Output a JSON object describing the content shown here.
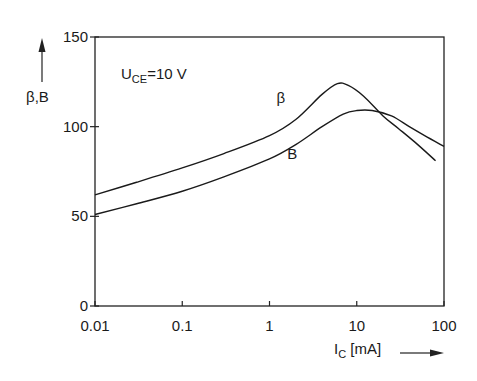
{
  "chart_data": {
    "type": "line",
    "title": "",
    "annotation": {
      "main": "U",
      "sub": "CE",
      "rest": "=10 V"
    },
    "xlabel": {
      "main": "I",
      "sub": "C",
      "rest": " [mA]"
    },
    "ylabel": "β,B",
    "xscale": "log",
    "xlim": [
      0.01,
      100
    ],
    "ylim": [
      0,
      150
    ],
    "xticks": [
      0.01,
      0.1,
      1,
      10,
      100
    ],
    "xtick_labels": [
      "0.01",
      "0.1",
      "1",
      "10",
      "100"
    ],
    "yticks": [
      0,
      50,
      100,
      150
    ],
    "ytick_labels": [
      "0",
      "50",
      "100",
      "150"
    ],
    "grid": false,
    "series": [
      {
        "name": "β",
        "label_at": [
          1.2,
          113
        ],
        "x": [
          0.01,
          0.03,
          0.1,
          0.3,
          1,
          2,
          4,
          6,
          8,
          12,
          20,
          30,
          50,
          80
        ],
        "y": [
          62,
          69,
          77,
          85,
          95,
          104,
          118,
          124,
          123,
          117,
          106,
          99,
          90,
          81
        ]
      },
      {
        "name": "B",
        "label_at": [
          1.6,
          82
        ],
        "x": [
          0.01,
          0.03,
          0.1,
          0.3,
          1,
          2,
          4,
          7,
          10,
          15,
          25,
          40,
          60,
          100
        ],
        "y": [
          51,
          57,
          64,
          72,
          82,
          90,
          100,
          107,
          109,
          109,
          106,
          100,
          95,
          89
        ]
      }
    ]
  }
}
